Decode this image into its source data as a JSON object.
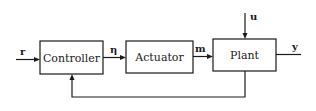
{
  "diagram": {
    "type": "block-diagram",
    "blocks": [
      {
        "id": "controller",
        "label": "Controller"
      },
      {
        "id": "actuator",
        "label": "Actuator"
      },
      {
        "id": "plant",
        "label": "Plant"
      }
    ],
    "signals": {
      "reference": "r",
      "control": "η",
      "manipulated": "m",
      "disturbance": "u",
      "output": "y"
    },
    "connections": [
      {
        "from": "input",
        "to": "controller",
        "label": "r"
      },
      {
        "from": "controller",
        "to": "actuator",
        "label": "η"
      },
      {
        "from": "actuator",
        "to": "plant",
        "label": "m"
      },
      {
        "from": "disturbance",
        "to": "plant",
        "label": "u"
      },
      {
        "from": "plant",
        "to": "output",
        "label": "y"
      },
      {
        "from": "plant",
        "to": "controller",
        "label": "feedback"
      }
    ],
    "colors": {
      "stroke": "#1a1a1a",
      "background": "#ffffff"
    }
  }
}
